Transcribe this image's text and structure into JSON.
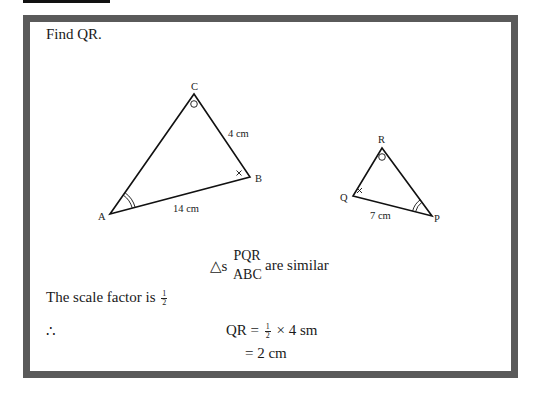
{
  "problem": {
    "title": "Find QR."
  },
  "figure": {
    "triangle_abc": {
      "vertices": {
        "A": "A",
        "B": "B",
        "C": "C"
      },
      "side_ab": "14 cm",
      "side_bc": "4 cm",
      "angle_marks": {
        "A": "double-arc",
        "B": "cross",
        "C": "circle"
      }
    },
    "triangle_pqr": {
      "vertices": {
        "P": "P",
        "Q": "Q",
        "R": "R"
      },
      "side_qp": "7 cm",
      "angle_marks": {
        "P": "double-arc",
        "Q": "cross",
        "R": "circle"
      }
    }
  },
  "solution": {
    "similar_prefix": "△s",
    "similar_top": "PQR",
    "similar_bottom": "ABC",
    "similar_suffix": "are similar",
    "scale_text": "The scale factor is",
    "scale_num": "1",
    "scale_den": "2",
    "therefore": "∴",
    "eq1_lhs": "QR =",
    "eq1_num": "1",
    "eq1_den": "2",
    "eq1_rhs": "× 4 sm",
    "eq2": "= 2 cm"
  }
}
